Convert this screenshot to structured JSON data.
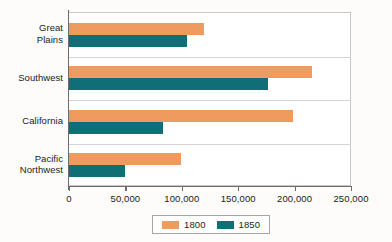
{
  "chart_data": {
    "type": "bar",
    "orientation": "horizontal",
    "title": "",
    "xlabel": "",
    "ylabel": "",
    "categories": [
      "Great Plains",
      "Southwest",
      "California",
      "Pacific Northwest"
    ],
    "category_lines": [
      [
        "Great",
        "Plains"
      ],
      [
        "Southwest"
      ],
      [
        "California"
      ],
      [
        "Pacific",
        "Northwest"
      ]
    ],
    "series": [
      {
        "name": "1800",
        "color": "#ef9a5f",
        "values": [
          120000,
          215000,
          199000,
          99000
        ]
      },
      {
        "name": "1850",
        "color": "#0f6e76",
        "values": [
          105000,
          176000,
          83000,
          50000
        ]
      }
    ],
    "xlim": [
      0,
      250000
    ],
    "xticks": [
      0,
      50000,
      100000,
      150000,
      200000,
      250000
    ],
    "xtick_labels": [
      "0",
      "50,000",
      "100,000",
      "150,000",
      "200,000",
      "250,000"
    ],
    "grid": true,
    "legend_position": "bottom",
    "legend_entries": [
      "1800",
      "1850"
    ]
  }
}
